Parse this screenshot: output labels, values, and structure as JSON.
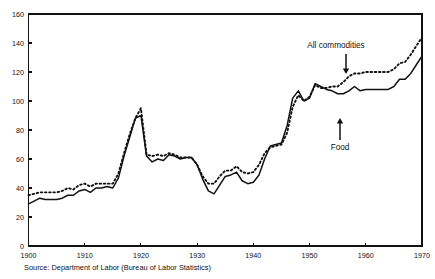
{
  "chart_data": {
    "type": "line",
    "title": "",
    "subtitle": "",
    "xlabel": "",
    "ylabel": "",
    "xlim": [
      1900,
      1970
    ],
    "ylim": [
      0,
      160
    ],
    "grid": false,
    "legend_position": "inline-annotations",
    "xticks": [
      "1900",
      "1910",
      "1920",
      "1930",
      "1940",
      "1950",
      "1960",
      "1970"
    ],
    "xtick_values": [
      1900,
      1910,
      1920,
      1930,
      1940,
      1950,
      1960,
      1970
    ],
    "yticks": [
      "0",
      "20",
      "40",
      "60",
      "80",
      "100",
      "120",
      "140",
      "160"
    ],
    "ytick_values": [
      0,
      20,
      40,
      60,
      80,
      100,
      120,
      140,
      160
    ],
    "x": [
      1900,
      1901,
      1902,
      1903,
      1904,
      1905,
      1906,
      1907,
      1908,
      1909,
      1910,
      1911,
      1912,
      1913,
      1914,
      1915,
      1916,
      1917,
      1918,
      1919,
      1920,
      1921,
      1922,
      1923,
      1924,
      1925,
      1926,
      1927,
      1928,
      1929,
      1930,
      1931,
      1932,
      1933,
      1934,
      1935,
      1936,
      1937,
      1938,
      1939,
      1940,
      1941,
      1942,
      1943,
      1944,
      1945,
      1946,
      1947,
      1948,
      1949,
      1950,
      1951,
      1952,
      1953,
      1954,
      1955,
      1956,
      1957,
      1958,
      1959,
      1960,
      1961,
      1962,
      1963,
      1964,
      1965,
      1966,
      1967,
      1968,
      1969,
      1970
    ],
    "series": [
      {
        "name": "Food",
        "style": "solid",
        "color": "#111111",
        "values": [
          29,
          31,
          33,
          32,
          32,
          32,
          33,
          35,
          35,
          38,
          39,
          37,
          40,
          40,
          41,
          40,
          47,
          62,
          75,
          88,
          90,
          62,
          58,
          60,
          59,
          63,
          62,
          60,
          61,
          61,
          56,
          46,
          38,
          36,
          42,
          48,
          49,
          51,
          45,
          43,
          44,
          49,
          60,
          69,
          70,
          71,
          83,
          102,
          107,
          100,
          102,
          112,
          110,
          108,
          107,
          105,
          105,
          107,
          110,
          107,
          108,
          108,
          108,
          108,
          108,
          110,
          115,
          115,
          119,
          125,
          131
        ]
      },
      {
        "name": "All commodities",
        "style": "dotted",
        "color": "#111111",
        "values": [
          35,
          36,
          37,
          37,
          37,
          37,
          38,
          40,
          39,
          42,
          43,
          41,
          43,
          43,
          43,
          43,
          50,
          64,
          77,
          88,
          95,
          63,
          62,
          63,
          62,
          64,
          63,
          61,
          61,
          61,
          56,
          48,
          43,
          43,
          48,
          52,
          52,
          55,
          51,
          50,
          51,
          56,
          64,
          68,
          69,
          70,
          78,
          96,
          104,
          100,
          103,
          111,
          109,
          109,
          110,
          110,
          113,
          117,
          119,
          119,
          120,
          120,
          120,
          120,
          120,
          122,
          126,
          127,
          132,
          138,
          144
        ]
      }
    ],
    "annotations": [
      {
        "name": "all-commodities",
        "text": "All commodities",
        "arrow_direction": "down"
      },
      {
        "name": "food",
        "text": "Food",
        "arrow_direction": "up"
      }
    ]
  },
  "source": {
    "note": "Source: Department of Labor (Bureau of Labor Statistics)"
  }
}
